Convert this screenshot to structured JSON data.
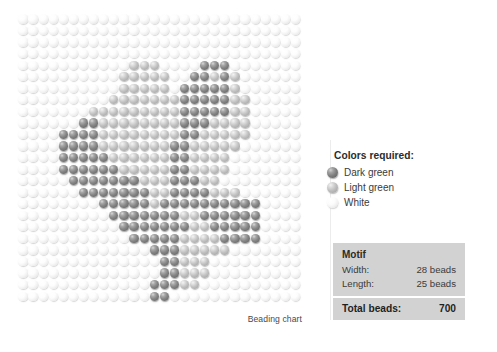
{
  "chart": {
    "caption": "Beading chart",
    "legend": {
      "title": "Colors required:",
      "items": [
        {
          "label": "Dark green",
          "code": "d",
          "color": "#7e7e7e"
        },
        {
          "label": "Light green",
          "code": "l",
          "color": "#bcbcbc"
        },
        {
          "label": "White",
          "code": "w",
          "color": "#f1f1f1"
        }
      ]
    },
    "spec": {
      "heading": "Motif",
      "rows": [
        {
          "label": "Width:",
          "value": "28 beads"
        },
        {
          "label": "Length:",
          "value": "25 beads"
        }
      ],
      "total_label": "Total beads:",
      "total_value": "700"
    },
    "grid": {
      "columns": 28,
      "rows": 25,
      "total": 700,
      "pattern": [
        "wwwwwwwwwwwwwwwwwwwwwwwwwwww",
        "wwwwwwwwwwwwwwwwwwwwwwwwwwww",
        "wwwwwwwwwwwwwwwwwwwwwwwwwwww",
        "wwwwwwwwwwwwwwwwwwwwwwwwwwww",
        "wwwwwwwwwwwlllwwwwdddwwwwwww",
        "wwwwwwwwwwlllllwwddldlwwwwww",
        "wwwwwwwwwwlllllwdddddlwwwwww",
        "wwwwwwwwwllllllldddddllwwwww",
        "wwwwwwwllllllllldddddllwwwww",
        "wwwwwwddlllllllldddllllwwwww",
        "wwwwddddllllllllddlllllwwwww",
        "wwwwddddlllllllddlllllwwwwww",
        "wwwwdddddllllllddllllwwwwwww",
        "wwwwddddddlllllddllllwwwwwww",
        "wwwwwdddddddllldddllwwwwwwww",
        "wwwwwwdddddddllddddlllwwwwww",
        "wwwwwwwwdddddlddddddddddwwww",
        "wwwwwwwwwdddddddllddddddwwww",
        "wwwwwwwwwwdddddddlldddddwwww",
        "wwwwwwwwwwwdddddllllddddwwww",
        "wwwwwwwwwwwwwdddlllllwwwwwww",
        "wwwwwwwwwwwwwwddlllwwwwwwwww",
        "wwwwwwwwwwwwwwddlllwwwwwwwww",
        "wwwwwwwwwwwwwdddllwwwwwwwwww",
        "wwwwwwwwwwwwwddwwwwwwwwwwwww"
      ]
    }
  }
}
